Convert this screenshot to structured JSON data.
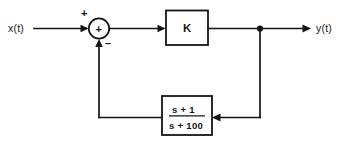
{
  "diagram": {
    "input_label": "x(t)",
    "output_label": "y(t)",
    "summing_junction": {
      "operator_symbol": "+",
      "positive_sign": "+",
      "negative_sign": "–",
      "icon": "summing-junction-icon"
    },
    "forward_block": {
      "label": "K"
    },
    "feedback_block": {
      "numerator": "s + 1",
      "denominator": "s + 100"
    },
    "colors": {
      "line": "#161616",
      "fill": "#ffffff",
      "background": "#ffffff"
    }
  }
}
